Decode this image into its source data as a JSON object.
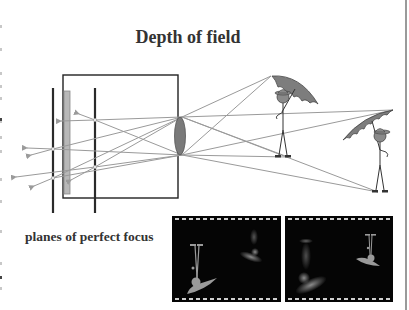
{
  "slide": {
    "title": "Depth of field",
    "caption": "planes of perfect focus"
  },
  "diagram": {
    "elements": [
      "camera-box",
      "image-sensor",
      "focus-plane-near",
      "focus-plane-far",
      "lens",
      "light-rays",
      "near-figure-with-umbrella",
      "far-figure-with-umbrella"
    ],
    "thumbnails": [
      {
        "label": "focus on near figure",
        "focus": "near"
      },
      {
        "label": "focus on far figure",
        "focus": "far"
      }
    ]
  },
  "colors": {
    "text": "#333333",
    "line": "#222222",
    "ray": "#9a9a9a",
    "sensor": "#b8b8b8",
    "lens": "#7a7a7a",
    "umbrella": "#7d7d7d",
    "film_bg": "#050505",
    "film_perf": "#cfcfcf"
  }
}
